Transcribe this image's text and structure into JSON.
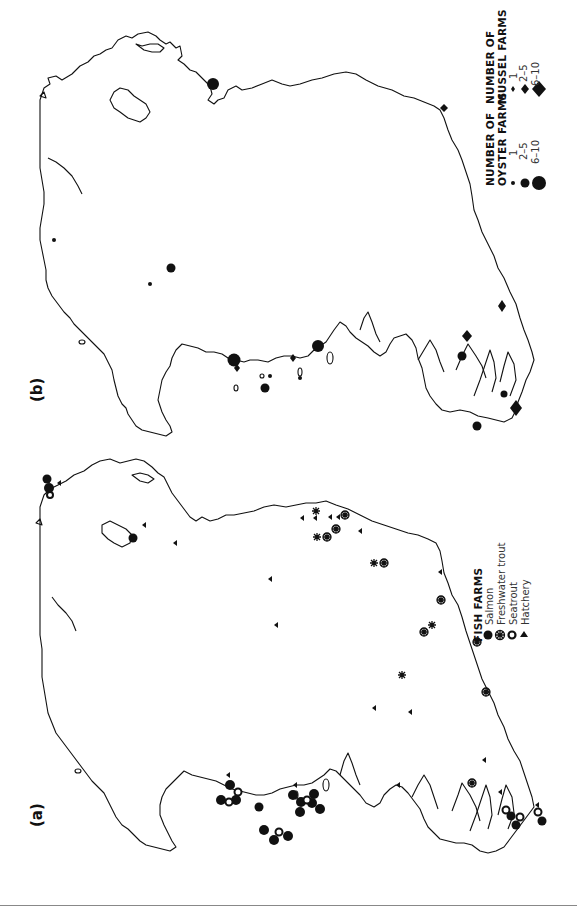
{
  "figure": {
    "orientation": "rotated 90° counter-clockwise",
    "panels": [
      {
        "id": "b",
        "label": "(b)",
        "legend": {
          "oyster": {
            "title_line1": "NUMBER OF",
            "title_line2": "OYSTER FARMS",
            "items": [
              {
                "label": "1",
                "symbol": "circle-small"
              },
              {
                "label": "2–5",
                "symbol": "circle-medium"
              },
              {
                "label": "6–10",
                "symbol": "circle-large"
              }
            ]
          },
          "mussel": {
            "title_line1": "NUMBER OF",
            "title_line2": "MUSSEL FARMS",
            "items": [
              {
                "label": "1",
                "symbol": "diamond-small"
              },
              {
                "label": "2–5",
                "symbol": "diamond-medium"
              },
              {
                "label": "6–10",
                "symbol": "diamond-large"
              }
            ]
          }
        }
      },
      {
        "id": "a",
        "label": "(a)",
        "legend": {
          "title": "FISH FARMS",
          "items": [
            {
              "label": "Salmon",
              "symbol": "filled-circle"
            },
            {
              "label": "Freshwater trout",
              "symbol": "asterisk-circle"
            },
            {
              "label": "Seatrout",
              "symbol": "open-circle"
            },
            {
              "label": "Hatchery",
              "symbol": "triangle"
            }
          ]
        }
      }
    ]
  },
  "colors": {
    "ink": "#111111",
    "background": "#ffffff",
    "rule": "#888888"
  }
}
